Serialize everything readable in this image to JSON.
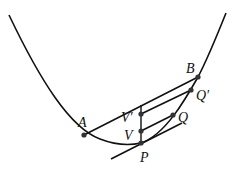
{
  "diagram": {
    "type": "parabola-segment",
    "colors": {
      "stroke": "#111111",
      "point": "#333333",
      "background": "#ffffff"
    },
    "points": {
      "A": {
        "label": "A",
        "x": 84,
        "y": 135
      },
      "B": {
        "label": "B",
        "x": 198,
        "y": 77
      },
      "Qp": {
        "label": "Q′",
        "x": 191,
        "y": 90
      },
      "Q": {
        "label": "Q",
        "x": 173,
        "y": 115
      },
      "Vp": {
        "label": "V′",
        "x": 141,
        "y": 114
      },
      "V": {
        "label": "V",
        "x": 141,
        "y": 131
      },
      "P": {
        "label": "P",
        "x": 141,
        "y": 143
      }
    },
    "labels": {
      "A": "A",
      "B": "B",
      "Qp": "Q′",
      "Q": "Q",
      "Vp": "V′",
      "V": "V",
      "P": "P"
    }
  }
}
